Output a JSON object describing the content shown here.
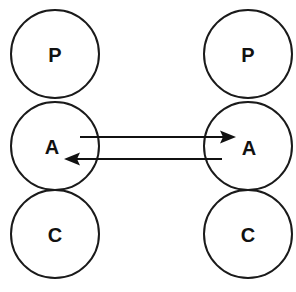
{
  "diagram": {
    "background_color": "#ffffff",
    "stroke_color": "#1a1a1a",
    "label_color": "#111111",
    "canvas": {
      "width": 296,
      "height": 292
    },
    "geometry": {
      "circle_radius": 44,
      "left_column_cx": 55,
      "right_column_cx": 248,
      "row_cy": [
        54,
        146,
        234
      ]
    },
    "columns": [
      {
        "id": "left-agent",
        "name": "left-column",
        "cx": 55,
        "nodes": [
          {
            "id": "left-p",
            "label": "P",
            "role": "presentation",
            "cx": 55,
            "cy": 54,
            "r": 44
          },
          {
            "id": "left-a",
            "label": "A",
            "role": "abstraction",
            "cx": 55,
            "cy": 146,
            "r": 44
          },
          {
            "id": "left-c",
            "label": "C",
            "role": "control",
            "cx": 55,
            "cy": 234,
            "r": 44
          }
        ]
      },
      {
        "id": "right-agent",
        "name": "right-column",
        "cx": 248,
        "nodes": [
          {
            "id": "right-p",
            "label": "P",
            "role": "presentation",
            "cx": 248,
            "cy": 54,
            "r": 44
          },
          {
            "id": "right-a",
            "label": "A",
            "role": "abstraction",
            "cx": 248,
            "cy": 146,
            "r": 44
          },
          {
            "id": "right-c",
            "label": "C",
            "role": "control",
            "cx": 248,
            "cy": 234,
            "r": 44
          }
        ]
      }
    ],
    "edges": [
      {
        "id": "edge-left-to-right",
        "label": "",
        "from": "left-a",
        "to": "right-a",
        "direction": "left-to-right",
        "y": 137,
        "x_start": 80,
        "x_end": 236,
        "arrow_at": "end"
      },
      {
        "id": "edge-right-to-left",
        "label": "",
        "from": "right-a",
        "to": "left-a",
        "direction": "right-to-left",
        "y": 159,
        "x_start": 222,
        "x_end": 64,
        "arrow_at": "end"
      }
    ]
  }
}
